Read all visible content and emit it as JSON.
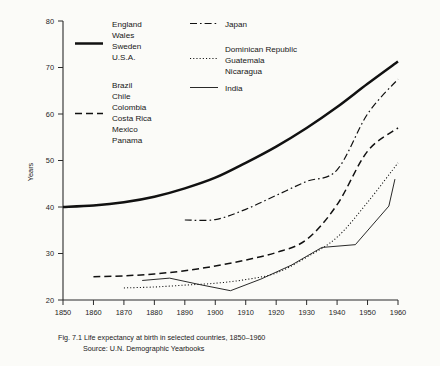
{
  "figure": {
    "caption_line1": "Fig. 7.1  Life expectancy at birth in selected countries, 1850–1960",
    "caption_line2": "Source:  U.N. Demographic Yearbooks"
  },
  "axes": {
    "ylabel": "Years",
    "yticks": [
      "20",
      "30",
      "40",
      "50",
      "60",
      "70",
      "80"
    ],
    "xticks": [
      "1850",
      "1860",
      "1870",
      "1880",
      "1890",
      "1900",
      "1910",
      "1920",
      "1930",
      "1940",
      "1950",
      "1960"
    ]
  },
  "legend": {
    "groups": [
      {
        "id": "developed",
        "style": "solid-thick",
        "labels": [
          "England",
          "Wales",
          "Sweden",
          "U.S.A."
        ]
      },
      {
        "id": "latin-america",
        "style": "dashed",
        "labels": [
          "Brazil",
          "Chile",
          "Colombia",
          "Costa Rica",
          "Mexico",
          "Panama"
        ]
      },
      {
        "id": "japan",
        "style": "dash-dot",
        "labels": [
          "Japan"
        ]
      },
      {
        "id": "central-america",
        "style": "dotted",
        "labels": [
          "Dominican Republic",
          "Guatemala",
          "Nicaragua"
        ]
      },
      {
        "id": "india",
        "style": "solid-thin",
        "labels": [
          "India"
        ]
      }
    ]
  },
  "chart_data": {
    "type": "line",
    "title": "Life expectancy at birth in selected countries, 1850–1960",
    "xlabel": "",
    "ylabel": "Years",
    "xlim": [
      1850,
      1960
    ],
    "ylim": [
      20,
      80
    ],
    "grid": false,
    "legend_position": "top",
    "series": [
      {
        "name": "England, Wales, Sweden, U.S.A.",
        "style": "solid-thick",
        "x": [
          1850,
          1860,
          1870,
          1880,
          1890,
          1900,
          1910,
          1920,
          1930,
          1940,
          1950,
          1960
        ],
        "y": [
          40.0,
          40.3,
          41.0,
          42.2,
          44.0,
          46.3,
          49.5,
          53.0,
          57.0,
          61.5,
          66.5,
          71.3
        ]
      },
      {
        "name": "Brazil, Chile, Colombia, Costa Rica, Mexico, Panama",
        "style": "dashed",
        "x": [
          1860,
          1870,
          1880,
          1890,
          1900,
          1910,
          1920,
          1930,
          1940,
          1950,
          1960
        ],
        "y": [
          25.0,
          25.2,
          25.6,
          26.3,
          27.3,
          28.6,
          30.2,
          33.0,
          40.5,
          52.0,
          57.0
        ]
      },
      {
        "name": "Japan",
        "style": "dash-dot",
        "x": [
          1890,
          1900,
          1910,
          1920,
          1930,
          1940,
          1950,
          1960
        ],
        "y": [
          37.2,
          37.3,
          39.5,
          42.5,
          45.5,
          48.0,
          60.0,
          67.5
        ]
      },
      {
        "name": "Dominican Republic, Guatemala, Nicaragua",
        "style": "dotted",
        "x": [
          1870,
          1880,
          1890,
          1900,
          1910,
          1920,
          1930,
          1940,
          1950,
          1960
        ],
        "y": [
          22.6,
          22.8,
          23.2,
          23.6,
          24.4,
          25.8,
          29.2,
          33.5,
          41.0,
          49.5
        ]
      },
      {
        "name": "India",
        "style": "solid-thin",
        "x": [
          1876,
          1885,
          1895,
          1905,
          1915,
          1925,
          1935,
          1946,
          1957,
          1959
        ],
        "y": [
          24.2,
          24.7,
          23.3,
          22.0,
          24.5,
          27.5,
          31.3,
          31.9,
          40.2,
          46.0
        ]
      }
    ]
  }
}
